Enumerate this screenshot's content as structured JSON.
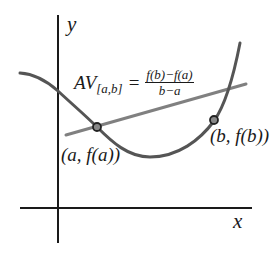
{
  "diagram": {
    "axes": {
      "x_label": "x",
      "y_label": "y"
    },
    "formula": {
      "lhs_main": "AV",
      "lhs_subscript": "[a,b]",
      "equals": "=",
      "numerator": "f(b)−f(a)",
      "denominator": "b−a"
    },
    "points": [
      {
        "label": "(a, f(a))",
        "name": "a"
      },
      {
        "label": "(b, f(b))",
        "name": "b"
      }
    ],
    "colors": {
      "curve": "#555555",
      "secant": "#808080",
      "axes": "#1a1a1a",
      "point_fill": "#888888",
      "point_stroke": "#222222"
    }
  }
}
